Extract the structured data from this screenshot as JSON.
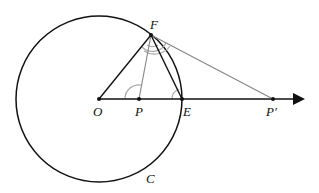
{
  "diagram": {
    "type": "geometry",
    "colors": {
      "main_stroke": "#111111",
      "secondary_stroke": "#888888",
      "angle_mark": "#aaaaaa",
      "background": "#ffffff"
    },
    "circle": {
      "label": "C",
      "center": [
        99,
        99
      ],
      "radius": 83
    },
    "points": {
      "O": {
        "label": "O",
        "x": 99,
        "y": 99
      },
      "P": {
        "label": "P",
        "x": 139,
        "y": 99
      },
      "E": {
        "label": "E",
        "x": 182,
        "y": 99
      },
      "Pprime": {
        "label": "P′",
        "x": 273,
        "y": 99
      },
      "F": {
        "label": "F",
        "x": 151,
        "y": 35
      }
    },
    "ray": {
      "from": "O",
      "to_x": 304,
      "arrow": true
    },
    "segments": [
      {
        "from": "O",
        "to": "F",
        "style": "main"
      },
      {
        "from": "P",
        "to": "F",
        "style": "secondary"
      },
      {
        "from": "E",
        "to": "F",
        "style": "main"
      },
      {
        "from": "Pprime",
        "to": "F",
        "style": "secondary"
      }
    ],
    "angle_marks": [
      "angle OPF",
      "angle OEF",
      "angles at F (double arcs)"
    ]
  }
}
